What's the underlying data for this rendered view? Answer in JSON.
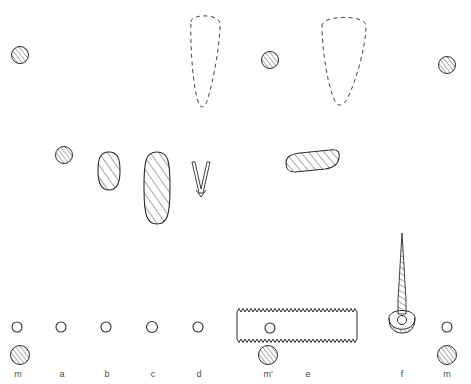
{
  "figure": {
    "background_color": "#ffffff",
    "ink_color": "#2b2b2b",
    "label_color": "#4a4a4a",
    "width": 471,
    "height": 384
  },
  "labels": [
    {
      "id": "label-m-left",
      "text": "m",
      "x": 18,
      "y": 375
    },
    {
      "id": "label-a",
      "text": "a",
      "x": 62,
      "y": 375
    },
    {
      "id": "label-b",
      "text": "b",
      "x": 107,
      "y": 375
    },
    {
      "id": "label-c",
      "text": "c",
      "x": 153,
      "y": 375
    },
    {
      "id": "label-d",
      "text": "d",
      "x": 199,
      "y": 375
    },
    {
      "id": "label-m-prime",
      "text": "m'",
      "x": 268,
      "y": 375
    },
    {
      "id": "label-e",
      "text": "e",
      "x": 308,
      "y": 375
    },
    {
      "id": "label-f",
      "text": "f",
      "x": 402,
      "y": 375
    },
    {
      "id": "label-m-right",
      "text": "m",
      "x": 447,
      "y": 375
    }
  ],
  "hatched_circles": [
    {
      "id": "hatched-circle-top-left",
      "cx": 20,
      "cy": 55,
      "r": 8.5
    },
    {
      "id": "hatched-circle-top-mid",
      "cx": 270,
      "cy": 60,
      "r": 8.5
    },
    {
      "id": "hatched-circle-top-right",
      "cx": 447,
      "cy": 65,
      "r": 8.5
    },
    {
      "id": "hatched-circle-mid-left",
      "cx": 64,
      "cy": 155,
      "r": 8.5
    },
    {
      "id": "hatched-circle-bottom-left",
      "cx": 20,
      "cy": 355,
      "r": 9.5
    },
    {
      "id": "hatched-circle-bottom-mprime",
      "cx": 268,
      "cy": 355,
      "r": 9.5
    },
    {
      "id": "hatched-circle-bottom-right",
      "cx": 447,
      "cy": 355,
      "r": 9.5
    }
  ],
  "open_circles": [
    {
      "id": "open-circle-m",
      "cx": 17,
      "cy": 327,
      "r": 5
    },
    {
      "id": "open-circle-a",
      "cx": 61,
      "cy": 327,
      "r": 5
    },
    {
      "id": "open-circle-b",
      "cx": 106,
      "cy": 327,
      "r": 5
    },
    {
      "id": "open-circle-c",
      "cx": 152,
      "cy": 327,
      "r": 5.5
    },
    {
      "id": "open-circle-d",
      "cx": 198,
      "cy": 327,
      "r": 5
    },
    {
      "id": "open-circle-e",
      "cx": 270,
      "cy": 328,
      "r": 5
    },
    {
      "id": "open-circle-mr",
      "cx": 447,
      "cy": 327,
      "r": 5
    }
  ],
  "dashed_outlines": [
    {
      "id": "dashed-teardrop-left",
      "description": "tapered dashed teardrop outline, apex down",
      "cx": 205,
      "top": 10,
      "bottom": 110,
      "half_width": 16
    },
    {
      "id": "dashed-teardrop-right",
      "description": "tapered dashed teardrop outline, apex down, wider",
      "cx": 343,
      "top": 15,
      "bottom": 105,
      "half_width": 23
    }
  ],
  "hatched_shapes": [
    {
      "id": "hatched-oval-b",
      "description": "small hatched oval (bead / spacer)",
      "cx": 109,
      "cy": 171,
      "rx": 11,
      "ry": 19
    },
    {
      "id": "hatched-oval-c",
      "description": "tall hatched oval (elongated bead)",
      "cx": 157,
      "cy": 188,
      "rx": 13,
      "ry": 36
    },
    {
      "id": "hatched-lozenge-e",
      "description": "horizontal hatched lozenge, slightly tilted",
      "cx": 311,
      "cy": 161,
      "rx": 27,
      "ry": 8
    }
  ],
  "v_shape": {
    "id": "v-shape-d",
    "description": "narrow V / tweezers outline",
    "apex_x": 201,
    "apex_y": 196,
    "top_y": 162,
    "half_span": 9
  },
  "serrated_bar": {
    "id": "serrated-bar-e",
    "description": "rectangle with zigzag (serrated) top and bottom edges, plain ends, small circle inside",
    "x": 237,
    "y": 312,
    "width": 120,
    "height": 27,
    "teeth": 30,
    "tooth_depth": 3.5
  },
  "needle": {
    "id": "needle-f",
    "description": "long tapered hatched needle/pin terminating in a crescent cup base with small ring",
    "tip_x": 402,
    "tip_y": 233,
    "base_x": 402,
    "base_y": 318,
    "shaft_half_width": 4.5,
    "crescent_cx": 402,
    "crescent_cy": 325,
    "crescent_r_outer": 13,
    "crescent_r_inner": 8,
    "ring_r": 4
  }
}
